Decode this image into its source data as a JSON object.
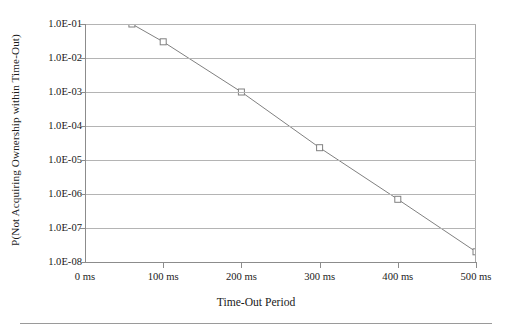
{
  "chart_data": {
    "type": "line",
    "title": "",
    "xlabel": "Time-Out Period",
    "ylabel": "P(Not Acquiring Ownership within Time-Out)",
    "yscale": "log",
    "xlim": [
      0,
      512
    ],
    "ylim": [
      1e-08,
      0.1
    ],
    "grid": true,
    "legend": "none",
    "marker": "open-square",
    "line_color": "#808080",
    "marker_color": "#808080",
    "grid_color": "#b4b4b4",
    "axis_color": "#8c8c8c",
    "x": [
      60,
      100,
      200,
      300,
      400,
      500
    ],
    "values": [
      0.1,
      0.03,
      0.001,
      2.3e-05,
      7e-07,
      2e-08
    ],
    "x_tick_labels": [
      "0 ms",
      "100 ms",
      "200 ms",
      "300 ms",
      "400 ms",
      "500 ms"
    ],
    "x_tick_values": [
      0,
      100,
      200,
      300,
      400,
      500
    ],
    "y_tick_labels": [
      "1.0E-01",
      "1.0E-02",
      "1.0E-03",
      "1.0E-04",
      "1.0E-05",
      "1.0E-06",
      "1.0E-07",
      "1.0E-08"
    ],
    "y_tick_values": [
      0.1,
      0.01,
      0.001,
      0.0001,
      1e-05,
      1e-06,
      1e-07,
      1e-08
    ]
  }
}
